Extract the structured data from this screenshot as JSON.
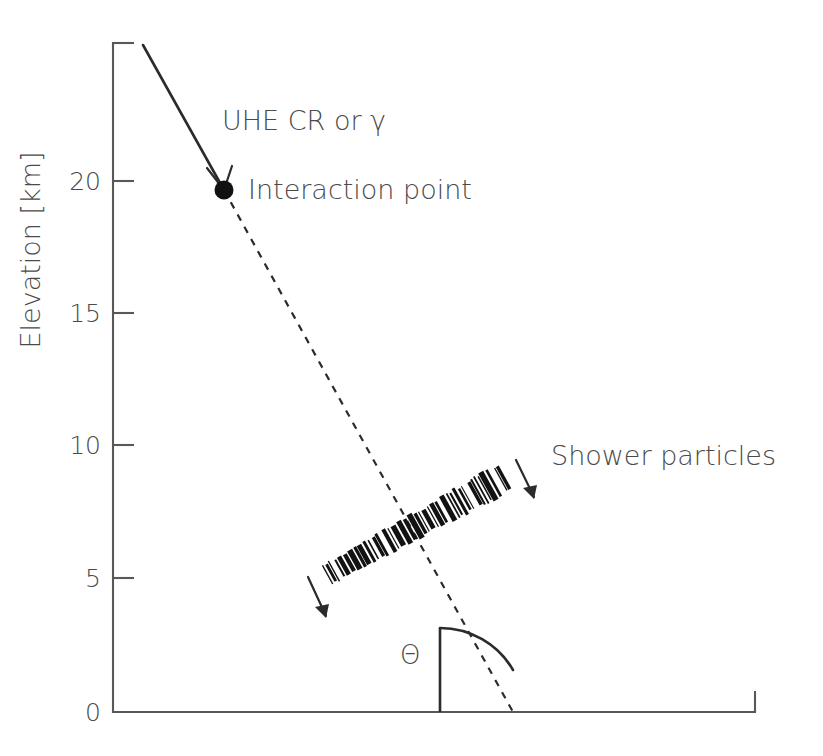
{
  "figure": {
    "background_color": "#ffffff",
    "ink_color": "#2b2b2b",
    "label_color": "#4a4a4a",
    "axis_color": "#585858"
  },
  "axes": {
    "y_title": "Elevation [km]",
    "y_ticks": [
      "20",
      "15",
      "10",
      "5",
      "0"
    ],
    "y_tick_values": [
      20,
      15,
      10,
      5,
      0
    ],
    "y_min": 0,
    "y_max": 25.3,
    "x_axis_label": "",
    "x_ticks": [],
    "grid": false
  },
  "annotations": {
    "primary": "UHE CR or γ",
    "interaction": "Interaction point",
    "shower": "Shower particles",
    "zenith_angle": "Θ"
  },
  "chart_data": {
    "type": "line",
    "xlabel": "",
    "ylabel": "Elevation [km]",
    "ylim": [
      0,
      25.3
    ],
    "xlim": [
      0,
      24
    ],
    "grid": false,
    "legend": "none",
    "series": [
      {
        "name": "UHE CR or γ",
        "style": "solid",
        "comment": "incoming primary particle track above first interaction",
        "points": [
          [
            1.2,
            25.3
          ],
          [
            4.25,
            19.6
          ]
        ]
      },
      {
        "name": "Shower axis",
        "style": "dashed",
        "comment": "shower axis continuing from interaction point to ground",
        "points": [
          [
            4.25,
            19.6
          ],
          [
            15.2,
            0.0
          ]
        ]
      },
      {
        "name": "Interaction point",
        "style": "marker",
        "comment": "first interaction of the primary in the atmosphere",
        "points": [
          [
            4.25,
            19.6
          ]
        ]
      },
      {
        "name": "Shower particle front",
        "style": "band",
        "comment": "dense barcode band of shower particles, perpendicular to shower axis",
        "points": [
          [
            8.15,
            5.2
          ],
          [
            14.8,
            8.85
          ]
        ]
      }
    ],
    "annotations": [
      {
        "text": "UHE CR or γ",
        "x": 5.0,
        "y": 23.1
      },
      {
        "text": "Interaction point",
        "x": 5.0,
        "y": 19.6
      },
      {
        "text": "Shower particles",
        "x": 20.0,
        "y": 9.2
      },
      {
        "text": "Θ",
        "x": 12.1,
        "y": 2.9
      }
    ],
    "zenith_angle_deg": 29
  },
  "geometry": {
    "plot_left_px": 113,
    "plot_bottom_px": 712,
    "plot_right_px": 755,
    "plot_top_px": 43,
    "tick_px": {
      "20": 181,
      "15": 313,
      "10": 445,
      "5": 578,
      "0": 712
    },
    "primary_track_px": [
      [
        143,
        45
      ],
      [
        224,
        190
      ]
    ],
    "dashed_track_px": [
      [
        224,
        190
      ],
      [
        513,
        712
      ]
    ],
    "interaction_dot_px": [
      224,
      190
    ],
    "shower_band_px": [
      [
        327,
        575
      ],
      [
        503,
        478
      ]
    ],
    "vertical_ref_px": [
      [
        440,
        712
      ],
      [
        440,
        628
      ]
    ],
    "theta_arc_px": {
      "cx": 440,
      "cy": 712,
      "r": 84,
      "start_deg": 90,
      "end_deg": 61
    }
  }
}
